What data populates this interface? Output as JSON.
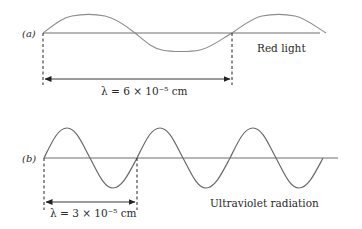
{
  "diagram": {
    "panel_a": {
      "panel_label": "(a)",
      "caption": "Red light",
      "wavelength_label": "λ = 6 × 10⁻⁵ cm",
      "wavelength_value": "6 × 10⁻⁵ cm",
      "wave_color": "#8c8c8c",
      "axis_color": "#6e6e6e"
    },
    "panel_b": {
      "panel_label": "(b)",
      "caption": "Ultraviolet radiation",
      "wavelength_label": "λ = 3 × 10⁻⁵ cm",
      "wavelength_value": "3 × 10⁻⁵ cm",
      "wave_color": "#6a6a6a",
      "axis_color": "#6e6e6e"
    }
  }
}
